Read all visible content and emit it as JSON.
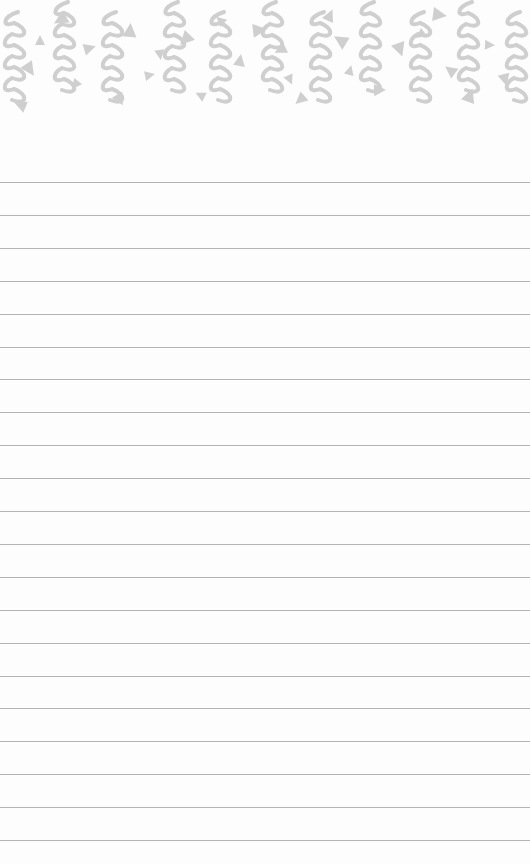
{
  "notepad": {
    "paper_color": "#fdfdfd",
    "line_color": "#b4b4b4",
    "pattern_color": "#cfcfcf",
    "first_line_y": 182,
    "line_spacing": 32.9,
    "line_count": 21,
    "header_pattern": "squiggles-and-triangles"
  }
}
